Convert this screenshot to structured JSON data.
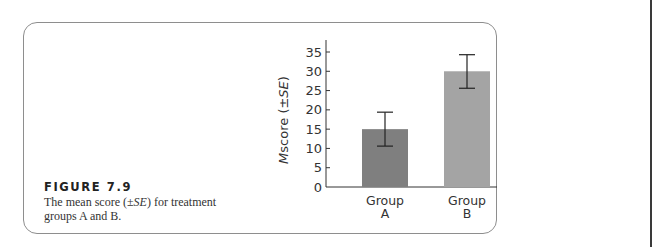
{
  "figure": {
    "label": "FIGURE 7.9",
    "caption_pre": "The mean score (±",
    "caption_se": "SE",
    "caption_post": ") for treatment groups A and B."
  },
  "colors": {
    "bar_a": "#7f7f7f",
    "bar_b": "#a4a4a4",
    "axis": "#333333",
    "frame": "#8e8e8e"
  },
  "chart_data": {
    "type": "bar",
    "title": "",
    "xlabel": "",
    "ylabel": "M score (±SE)",
    "categories": [
      "Group A",
      "Group B"
    ],
    "category_lines": [
      [
        "Group",
        "A"
      ],
      [
        "Group",
        "B"
      ]
    ],
    "values": [
      15,
      30
    ],
    "error_bars": {
      "type": "SE",
      "lower": [
        10.6,
        25.6
      ],
      "upper": [
        19.4,
        34.3
      ]
    },
    "ylim": [
      0,
      35
    ],
    "yticks": [
      0,
      5,
      10,
      15,
      20,
      25,
      30,
      35
    ],
    "grid": false,
    "legend": null
  }
}
